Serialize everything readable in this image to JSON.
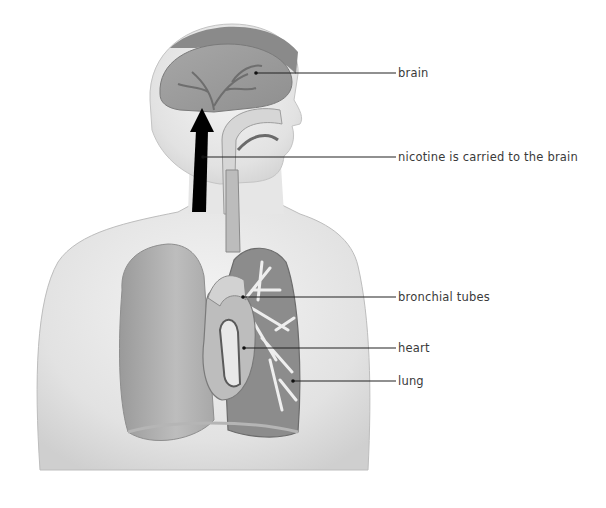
{
  "diagram": {
    "arrow": {
      "direction": "up",
      "meaning": "nicotine is carried to the brain",
      "color": "#000000"
    },
    "labels": [
      {
        "id": "brain",
        "text": "brain",
        "line_y": 73,
        "text_x": 398,
        "point": [
          256,
          73
        ]
      },
      {
        "id": "nicotine",
        "text": "nicotine is carried to the brain",
        "line_y": 157,
        "text_x": 398,
        "point": [
          203,
          157
        ]
      },
      {
        "id": "bronchial",
        "text": "bronchial tubes",
        "line_y": 297,
        "text_x": 398,
        "point": [
          243,
          297
        ]
      },
      {
        "id": "heart",
        "text": "heart",
        "line_y": 348,
        "text_x": 398,
        "point": [
          244,
          348
        ]
      },
      {
        "id": "lung",
        "text": "lung",
        "line_y": 381,
        "text_x": 398,
        "point": [
          293,
          381
        ]
      }
    ]
  }
}
